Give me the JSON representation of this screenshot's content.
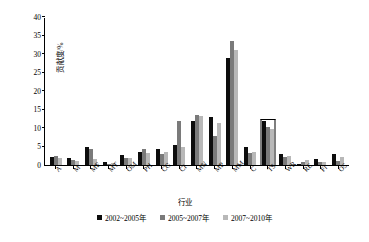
{
  "chart_data": {
    "type": "bar",
    "title": "",
    "xlabel": "行业",
    "ylabel": "贡献度/%",
    "ylim": [
      0,
      40
    ],
    "ytick_step": 5,
    "yticks": [
      0,
      5,
      10,
      15,
      20,
      25,
      30,
      35,
      40
    ],
    "grid": false,
    "legend_position": "bottom",
    "categories": [
      "A",
      "M",
      "MF",
      "MT",
      "OM",
      "PH",
      "CG",
      "CI",
      "MN",
      "MP",
      "MM",
      "C",
      "TS",
      "WR",
      "RE",
      "FI",
      "OS"
    ],
    "series": [
      {
        "name": "2002~2005年",
        "color": "#0d0d0d",
        "values": [
          2.2,
          1.8,
          4.8,
          0.7,
          2.8,
          3.5,
          4.2,
          5.3,
          11.8,
          13.0,
          29.0,
          5.0,
          12.0,
          3.0,
          0.3,
          1.5,
          3.0
        ]
      },
      {
        "name": "2005~2007年",
        "color": "#7a7a7a",
        "values": [
          2.5,
          1.3,
          4.2,
          0.4,
          2.0,
          4.4,
          2.9,
          12.0,
          13.5,
          7.8,
          33.5,
          3.2,
          10.3,
          2.1,
          0.9,
          0.8,
          1.2
        ]
      },
      {
        "name": "2007~2010年",
        "color": "#b8b8b8",
        "values": [
          1.8,
          1.1,
          1.5,
          0.5,
          1.8,
          3.2,
          3.5,
          4.8,
          13.2,
          11.4,
          31.0,
          3.6,
          9.8,
          2.4,
          1.3,
          0.9,
          2.2
        ]
      }
    ],
    "annotations": [
      {
        "type": "outline-box",
        "category": "TS",
        "top_value": 12.4,
        "note": "highlight rectangle around TS group"
      }
    ]
  }
}
